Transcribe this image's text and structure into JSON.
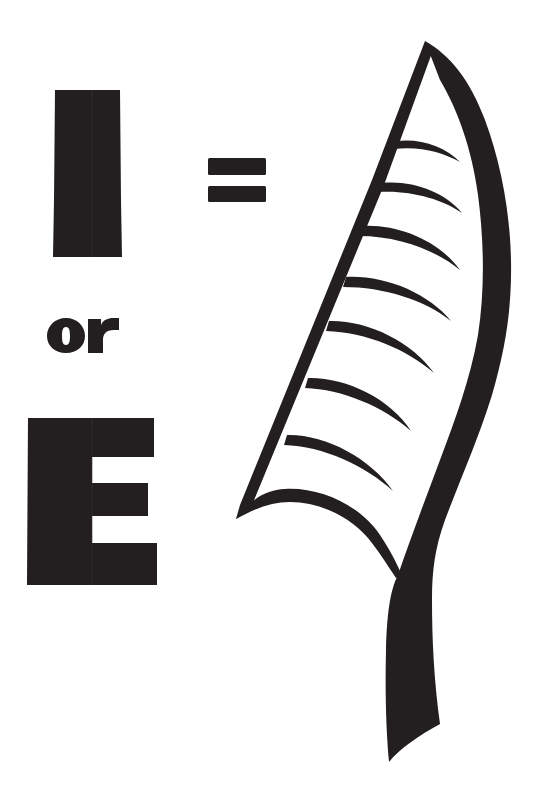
{
  "figure": {
    "fill_color": "#231f20",
    "background_color": "#ffffff",
    "letters": {
      "first": "I",
      "connector": "or",
      "second": "E"
    },
    "operator": "=",
    "leaf": {
      "vein_count": 8,
      "has_stem": true
    },
    "bleed_through_text": {
      "line1": "",
      "line2": ""
    }
  }
}
